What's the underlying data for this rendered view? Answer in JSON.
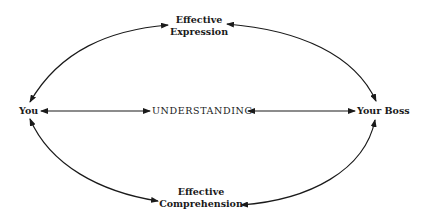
{
  "diagram": {
    "nodes": {
      "top": {
        "line1": "Effective",
        "line2": "Expression"
      },
      "bottom": {
        "line1": "Effective",
        "line2": "Comprehension"
      },
      "left": {
        "label": "You"
      },
      "right": {
        "label": "Your Boss"
      },
      "center": {
        "label": "UNDERSTANDING"
      }
    },
    "edges": [
      {
        "from": "You",
        "to": "Effective Expression",
        "type": "bidirectional-curve"
      },
      {
        "from": "Effective Expression",
        "to": "Your Boss",
        "type": "bidirectional-curve"
      },
      {
        "from": "You",
        "to": "Effective Comprehension",
        "type": "bidirectional-curve"
      },
      {
        "from": "Effective Comprehension",
        "to": "Your Boss",
        "type": "bidirectional-curve"
      },
      {
        "from": "You",
        "to": "UNDERSTANDING",
        "type": "bidirectional-line"
      },
      {
        "from": "UNDERSTANDING",
        "to": "Your Boss",
        "type": "bidirectional-line"
      }
    ],
    "colors": {
      "ink": "#1a1a1a",
      "background": "#ffffff"
    }
  }
}
